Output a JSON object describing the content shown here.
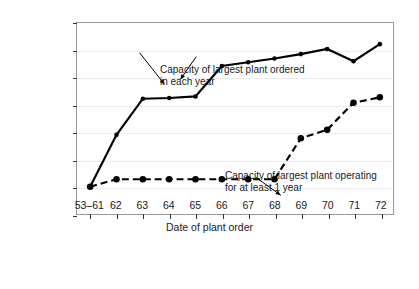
{
  "chart_data": {
    "type": "line",
    "title": "",
    "xlabel": "Date of plant order",
    "ylabel": "Electrical output (MWe)",
    "ylim": [
      0,
      1400
    ],
    "yticks": [
      0,
      200,
      400,
      600,
      800,
      1000,
      1200,
      1400
    ],
    "categories": [
      "53–61",
      "62",
      "63",
      "64",
      "65",
      "66",
      "67",
      "68",
      "69",
      "70",
      "71",
      "72"
    ],
    "grid": true,
    "legend": "none",
    "series": [
      {
        "name": "Capacity of largest plant ordered in each year",
        "style": "solid",
        "color": "#000000",
        "marker": "circle",
        "values": [
          200,
          580,
          845,
          850,
          862,
          1085,
          1112,
          1140,
          1172,
          1210,
          1120,
          1245
        ]
      },
      {
        "name": "Capacity of largest plant operating for at least 1 year",
        "style": "dashed",
        "color": "#000000",
        "marker": "circle",
        "values": [
          200,
          255,
          255,
          255,
          255,
          255,
          255,
          255,
          555,
          618,
          815,
          855
        ]
      }
    ],
    "annotations": [
      {
        "id": "ordered",
        "line1": "Capacity of largest plant ordered",
        "line2": "in each year"
      },
      {
        "id": "operating",
        "line1": "Capacity of largest plant operating",
        "line2": "for at least 1 year"
      }
    ]
  }
}
